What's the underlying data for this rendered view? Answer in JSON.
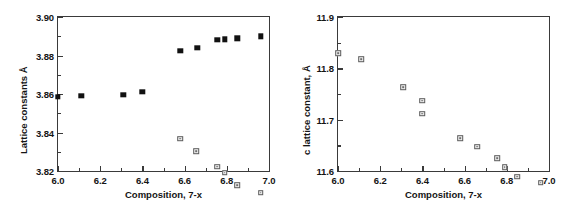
{
  "figure": {
    "panels": [
      {
        "id": "panel-a",
        "xlabel": "Composition, 7-x",
        "ylabel": "Lattice constants Å",
        "xlim": [
          6.0,
          7.0
        ],
        "ylim": [
          3.82,
          3.9
        ],
        "xticks": [
          "6.0",
          "6.2",
          "6.4",
          "6.6",
          "6.8",
          "7.0"
        ],
        "xtick_values": [
          6.0,
          6.2,
          6.4,
          6.6,
          6.8,
          7.0
        ],
        "yticks": [
          "3.82",
          "3.84",
          "3.86",
          "3.88",
          "3.90"
        ],
        "ytick_values": [
          3.82,
          3.84,
          3.86,
          3.88,
          3.9
        ]
      },
      {
        "id": "panel-b",
        "xlabel": "Composition, 7-x",
        "ylabel": "c lattice constant, Å",
        "xlim": [
          6.0,
          7.0
        ],
        "ylim": [
          11.6,
          11.9
        ],
        "xticks": [
          "6.0",
          "6.2",
          "6.4",
          "6.6",
          "6.8",
          "7.0"
        ],
        "xtick_values": [
          6.0,
          6.2,
          6.4,
          6.6,
          6.8,
          7.0
        ],
        "yticks": [
          "11.6",
          "11.7",
          "11.8",
          "11.9"
        ],
        "ytick_values": [
          11.6,
          11.7,
          11.8,
          11.9
        ]
      }
    ]
  },
  "chart_data": [
    {
      "type": "scatter",
      "title": "",
      "xlabel": "Composition, 7-x",
      "ylabel": "Lattice constants Å",
      "xlim": [
        6.0,
        7.0
      ],
      "ylim": [
        3.82,
        3.9
      ],
      "grid": false,
      "legend": "none",
      "series": [
        {
          "name": "a-axis (filled squares, low-x branch)",
          "marker": "filled-square",
          "color": "#111111",
          "points": [
            [
              6.0,
              3.8585
            ],
            [
              6.11,
              3.859
            ],
            [
              6.31,
              3.8595
            ],
            [
              6.4,
              3.861
            ]
          ]
        },
        {
          "name": "a-axis (filled squares, high-x branch)",
          "marker": "filled-square",
          "color": "#111111",
          "points": [
            [
              6.58,
              3.8825
            ],
            [
              6.66,
              3.884
            ],
            [
              6.755,
              3.888
            ],
            [
              6.79,
              3.8885
            ],
            [
              6.85,
              3.889
            ],
            [
              6.96,
              3.89
            ]
          ]
        },
        {
          "name": "b-axis (open squares)",
          "marker": "open-square",
          "color": "#5c5c5c",
          "points": [
            [
              6.58,
              3.8368
            ],
            [
              6.655,
              3.8332
            ],
            [
              6.755,
              3.828
            ],
            [
              6.79,
              3.8278
            ],
            [
              6.85,
              3.8242
            ],
            [
              6.96,
              3.8232
            ]
          ]
        }
      ]
    },
    {
      "type": "scatter",
      "title": "",
      "xlabel": "Composition, 7-x",
      "ylabel": "c lattice constant, Å",
      "xlim": [
        11.6,
        11.9
      ],
      "ylim": [
        11.6,
        11.9
      ],
      "grid": false,
      "legend": "none",
      "series": [
        {
          "name": "c-axis (open squares)",
          "marker": "open-square",
          "color": "#5c5c5c",
          "points": [
            [
              6.0,
              11.83
            ],
            [
              6.11,
              11.829
            ],
            [
              6.31,
              11.785
            ],
            [
              6.4,
              11.77
            ],
            [
              6.4,
              11.755
            ],
            [
              6.58,
              11.718
            ],
            [
              6.66,
              11.713
            ],
            [
              6.755,
              11.701
            ],
            [
              6.79,
              11.695
            ],
            [
              6.85,
              11.687
            ],
            [
              6.96,
              11.686
            ]
          ]
        }
      ]
    }
  ]
}
